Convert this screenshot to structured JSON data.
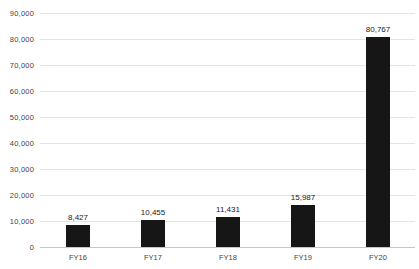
{
  "chart_data": {
    "type": "bar",
    "title": "",
    "xlabel": "",
    "ylabel": "",
    "categories": [
      "FY16",
      "FY17",
      "FY18",
      "FY19",
      "FY20"
    ],
    "values": [
      8427,
      10455,
      11431,
      15987,
      80767
    ],
    "value_labels": [
      "8,427",
      "10,455",
      "11,431",
      "15,987",
      "80,767"
    ],
    "ylim": [
      0,
      90000
    ],
    "ytick_step": 10000,
    "ytick_labels": [
      "0",
      "10,000",
      "20,000",
      "30,000",
      "40,000",
      "50,000",
      "60,000",
      "70,000",
      "80,000",
      "90,000"
    ],
    "grid": "horizontal",
    "legend": "none",
    "colors": {
      "bar": "#161616",
      "gridline": "#e4e4e4",
      "axis_line": "#c6c6c6",
      "tick_text": "#3f3f3f",
      "value_label_text": "#1a1a1a",
      "background": "#ffffff"
    }
  }
}
